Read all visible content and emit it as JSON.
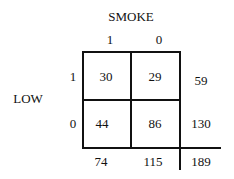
{
  "table": {
    "column_variable": "SMOKE",
    "row_variable": "LOW",
    "column_levels": [
      "1",
      "0"
    ],
    "row_levels": [
      "1",
      "0"
    ],
    "cells": [
      [
        "30",
        "29"
      ],
      [
        "44",
        "86"
      ]
    ],
    "row_totals": [
      "59",
      "130"
    ],
    "column_totals": [
      "74",
      "115"
    ],
    "grand_total": "189"
  }
}
